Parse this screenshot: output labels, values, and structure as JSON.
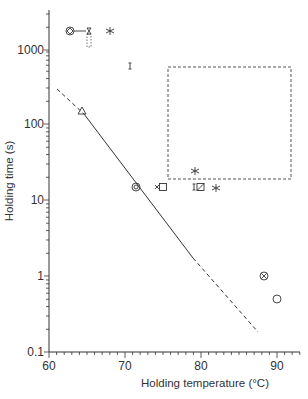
{
  "chart_data": {
    "type": "scatter",
    "title": "",
    "xlabel": "Holding temperature (°C)",
    "ylabel": "Holding time (s)",
    "xlim": [
      60,
      93
    ],
    "ylim": [
      0.1,
      4000
    ],
    "yscale": "log",
    "x_ticks": [
      "60",
      "70",
      "80",
      "90"
    ],
    "y_ticks": [
      "0.1",
      "1",
      "10",
      "100",
      "1000"
    ],
    "grid": false,
    "points": [
      {
        "marker": "circle-with-diamond",
        "x": 62.8,
        "y": 1780
      },
      {
        "marker": "circle-arrow-to-hourglass",
        "x": 65.3,
        "y": 1780,
        "note": "connected by line to previous point, with dotted range box below"
      },
      {
        "marker": "asterisk",
        "x": 68.0,
        "y": 1780
      },
      {
        "marker": "error-bar-I",
        "x": 70.7,
        "y": 610
      },
      {
        "marker": "triangle",
        "x": 64.3,
        "y": 155
      },
      {
        "marker": "circle-double",
        "x": 71.4,
        "y": 15
      },
      {
        "marker": "x-square",
        "x": 74.8,
        "y": 15
      },
      {
        "marker": "I-slashed-square",
        "x": 79.6,
        "y": 15
      },
      {
        "marker": "asterisk",
        "x": 79.0,
        "y": 24
      },
      {
        "marker": "asterisk",
        "x": 82.0,
        "y": 14
      },
      {
        "marker": "circle-x",
        "x": 88.3,
        "y": 1.0
      },
      {
        "marker": "circle",
        "x": 90.0,
        "y": 0.5
      }
    ],
    "regions": [
      {
        "type": "dashed-rectangle",
        "x": [
          75.7,
          91.9
        ],
        "y": [
          19,
          600
        ]
      }
    ],
    "lines": [
      {
        "style": "dashed",
        "x": [
          61.0,
          64.6
        ],
        "y": [
          300,
          140
        ]
      },
      {
        "style": "solid",
        "x": [
          64.6,
          82.0
        ],
        "y": [
          140,
          0.76
        ]
      },
      {
        "style": "dashed",
        "x": [
          82.0,
          87.5
        ],
        "y": [
          0.76,
          0.18
        ]
      }
    ]
  }
}
